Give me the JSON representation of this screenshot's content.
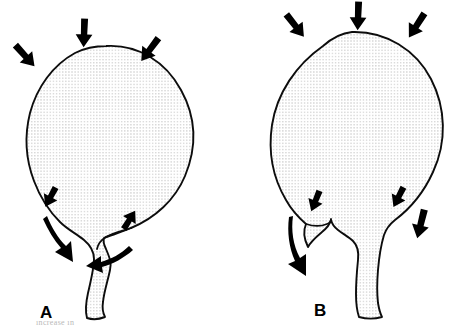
{
  "figure": {
    "background_color": "#ffffff",
    "ink_color": "#000000",
    "outline_color": "#0d0d0d",
    "stipple_color": "#9a9a9a",
    "width": 476,
    "height": 332
  },
  "panels": [
    {
      "id": "A",
      "label": "A",
      "label_x": 40,
      "label_y": 318,
      "description": "Rounded bladder with angled neck, compressive arrows on dome and outlet"
    },
    {
      "id": "B",
      "label": "B",
      "label_x": 314,
      "label_y": 316,
      "description": "Globular bladder with central descending neck, compressive arrows on dome and outlet"
    }
  ],
  "arrows": {
    "panel_a": [
      {
        "name": "dome-left-arrow",
        "direction": "down-right"
      },
      {
        "name": "dome-top-arrow",
        "direction": "down"
      },
      {
        "name": "dome-right-arrow",
        "direction": "down-left"
      },
      {
        "name": "neck-upper-arrow",
        "direction": "down-right"
      },
      {
        "name": "neck-curved-arrow",
        "direction": "down-curved"
      },
      {
        "name": "outlet-right-arrow",
        "direction": "down-left"
      },
      {
        "name": "outlet-curved-arrow",
        "direction": "left-curved"
      }
    ],
    "panel_b": [
      {
        "name": "dome-left-arrow",
        "direction": "down-right"
      },
      {
        "name": "dome-top-arrow",
        "direction": "down"
      },
      {
        "name": "dome-right-arrow",
        "direction": "down-left"
      },
      {
        "name": "neck-left-arrow",
        "direction": "down-right"
      },
      {
        "name": "neck-curved-arrow",
        "direction": "down-curved"
      },
      {
        "name": "neck-right-arrow",
        "direction": "down-right"
      },
      {
        "name": "outlet-right-arrow",
        "direction": "down"
      }
    ]
  },
  "caption": {
    "visible_fragment": "increase in"
  }
}
